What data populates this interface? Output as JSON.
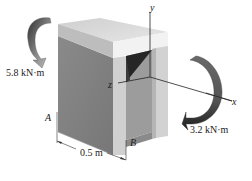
{
  "diagram": {
    "type": "3d-channel-beam-with-moments",
    "labels": {
      "moment_left": "5.8 kN·m",
      "moment_right": "3.2 kN·m",
      "point_a": "A",
      "point_b": "B",
      "dimension": "0.5 m",
      "axis_x": "x",
      "axis_y": "y",
      "axis_z": "z"
    },
    "colors": {
      "top_face": "#dcdcdc",
      "top_front_edge": "#f0f0f0",
      "side_face": "#8c8c8c",
      "front_flange": "#c8c8c8",
      "inner_dark": "#2a2a2a",
      "web_inner": "#9a9a9a",
      "arrow_dark": "#3a3a3a",
      "arrow_light": "#a8a8a8",
      "axis_line": "#222222"
    }
  }
}
